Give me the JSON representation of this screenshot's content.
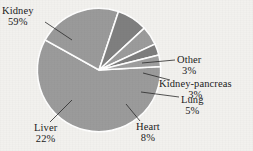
{
  "chart_data": {
    "type": "pie",
    "title": "",
    "subtitle": "",
    "xlabel": "",
    "ylabel": "",
    "legend_position": "none",
    "labels_position": "outside-with-leader-lines",
    "grid": false,
    "categories": [
      "Kidney",
      "Liver",
      "Heart",
      "Lung",
      "Kidney-pancreas",
      "Other"
    ],
    "values": [
      59,
      22,
      8,
      5,
      3,
      3
    ],
    "value_unit": "%",
    "slices": [
      {
        "name": "Kidney",
        "label": "Kidney",
        "pct_text": "59%",
        "value": 59,
        "color": "#9b9b9b"
      },
      {
        "name": "Liver",
        "label": "Liver",
        "pct_text": "22%",
        "value": 22,
        "color": "#9a9a9a"
      },
      {
        "name": "Heart",
        "label": "Heart",
        "pct_text": "8%",
        "value": 8,
        "color": "#7f7f7f"
      },
      {
        "name": "Lung",
        "label": "Lung",
        "pct_text": "5%",
        "value": 5,
        "color": "#9b9b9b"
      },
      {
        "name": "Kidney-pancreas",
        "label": "Kidney-pancreas",
        "pct_text": "3%",
        "value": 3,
        "color": "#7d7d7d"
      },
      {
        "name": "Other",
        "label": "Other",
        "pct_text": "3%",
        "value": 3,
        "color": "#9e9e9e"
      }
    ]
  },
  "colors": {
    "background": "#f2f1ee",
    "text": "#1b1b1b",
    "slice_light": "#9b9b9b",
    "slice_dark": "#7f7f7f",
    "separator": "#ffffff",
    "leader_line": "#2a2a2a"
  },
  "labels": {
    "kidney": {
      "name": "Kidney",
      "pct": "59%"
    },
    "liver": {
      "name": "Liver",
      "pct": "22%"
    },
    "heart": {
      "name": "Heart",
      "pct": "8%"
    },
    "lung": {
      "name": "Lung",
      "pct": "5%"
    },
    "kidney_pancreas": {
      "name": "Kidney-pancreas",
      "pct": "3%"
    },
    "other": {
      "name": "Other",
      "pct": "3%"
    }
  }
}
